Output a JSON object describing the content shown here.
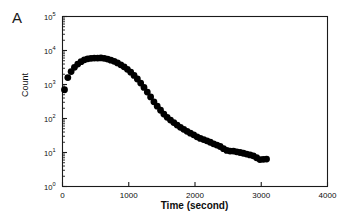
{
  "panel": {
    "label": "A"
  },
  "chart_data": {
    "type": "scatter",
    "title": "",
    "xlabel": "Time (second)",
    "ylabel": "Count",
    "xscale": "linear",
    "yscale": "log",
    "xlim": [
      0,
      4000
    ],
    "ylim": [
      1,
      100000
    ],
    "xticks": [
      0,
      1000,
      2000,
      3000,
      4000
    ],
    "xtick_labels": [
      "0",
      "1000",
      "2000",
      "3000",
      "4000"
    ],
    "yticks": [
      1,
      10,
      100,
      1000,
      10000,
      100000
    ],
    "ytick_labels": [
      "10 0",
      "10 1",
      "10 2",
      "10 3",
      "10 4",
      "10 5"
    ],
    "ytick_mantissa": [
      "10",
      "10",
      "10",
      "10",
      "10",
      "10"
    ],
    "ytick_exponents": [
      "0",
      "1",
      "2",
      "3",
      "4",
      "5"
    ],
    "grid": false,
    "legend": false,
    "minor_ticks": true,
    "marker": "filled-circle",
    "marker_color": "#000000",
    "marker_size": 3.4,
    "series": [
      {
        "name": "count",
        "x": [
          30,
          80,
          130,
          180,
          230,
          280,
          330,
          380,
          430,
          480,
          530,
          580,
          630,
          680,
          730,
          780,
          830,
          880,
          930,
          980,
          1030,
          1080,
          1130,
          1180,
          1230,
          1280,
          1330,
          1380,
          1430,
          1480,
          1530,
          1580,
          1630,
          1680,
          1730,
          1780,
          1830,
          1880,
          1930,
          1980,
          2030,
          2080,
          2130,
          2180,
          2230,
          2280,
          2330,
          2380,
          2430,
          2480,
          2530,
          2580,
          2630,
          2680,
          2730,
          2780,
          2830,
          2880,
          2930,
          2980,
          3030,
          3080
        ],
        "y": [
          700,
          1600,
          2400,
          3200,
          4000,
          4700,
          5300,
          5700,
          5900,
          6000,
          6000,
          6050,
          5900,
          5600,
          5200,
          4800,
          4300,
          3800,
          3300,
          2800,
          2300,
          1850,
          1450,
          1100,
          820,
          600,
          430,
          310,
          230,
          175,
          135,
          108,
          90,
          76,
          64,
          55,
          48,
          42,
          37,
          33,
          29,
          26,
          24,
          22,
          20,
          18,
          16.5,
          15,
          13,
          11.5,
          11,
          11,
          10.5,
          10,
          9.5,
          9,
          8.5,
          8,
          7,
          6.2,
          6.3,
          6.4
        ]
      }
    ]
  }
}
